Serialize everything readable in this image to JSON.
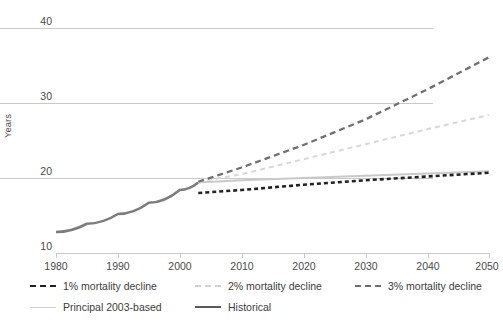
{
  "chart_data": {
    "type": "line",
    "title": "",
    "xlabel": "",
    "ylabel": "Years",
    "xlim": [
      1975,
      2050
    ],
    "ylim": [
      8.5,
      42
    ],
    "grid": true,
    "xticks": [
      1980,
      1990,
      2000,
      2010,
      2020,
      2030,
      2040,
      2050
    ],
    "yticks": [
      10,
      20,
      30,
      40
    ],
    "legend_position": "bottom",
    "series": [
      {
        "name": "Historical",
        "style": "solid",
        "color": "#7d7d7d",
        "x": [
          1980,
          1985,
          1990,
          1995,
          2000,
          2003
        ],
        "values": [
          12.8,
          13.9,
          15.2,
          16.7,
          18.4,
          19.4
        ]
      },
      {
        "name": "Principal 2003-based",
        "style": "solid",
        "color": "#c9c9c9",
        "x": [
          2003,
          2010,
          2020,
          2030,
          2040,
          2050
        ],
        "values": [
          19.4,
          19.7,
          20.0,
          20.3,
          20.6,
          20.9
        ]
      },
      {
        "name": "1% mortality decline",
        "style": "dashed",
        "color": "#222222",
        "x": [
          2003,
          2010,
          2020,
          2030,
          2040,
          2050
        ],
        "values": [
          18.0,
          18.4,
          19.1,
          19.7,
          20.2,
          20.7
        ]
      },
      {
        "name": "2% mortality decline",
        "style": "dashed",
        "color": "#d8d8d8",
        "x": [
          2003,
          2010,
          2020,
          2030,
          2040,
          2050
        ],
        "values": [
          19.5,
          20.5,
          22.5,
          24.5,
          26.5,
          28.4
        ]
      },
      {
        "name": "3% mortality decline",
        "style": "dashed",
        "color": "#707070",
        "x": [
          2003,
          2010,
          2020,
          2030,
          2040,
          2050
        ],
        "values": [
          19.5,
          21.4,
          24.4,
          27.8,
          31.8,
          36.1
        ]
      }
    ]
  },
  "axis": {
    "ylabel": "Years",
    "ytick_labels": [
      "40",
      "30",
      "20",
      "10"
    ],
    "xtick_labels": [
      "1980",
      "1990",
      "2000",
      "2010",
      "2020",
      "2030",
      "2040",
      "2050"
    ]
  },
  "legend": {
    "row1": [
      {
        "label": "1% mortality decline",
        "swatch": "dash-dark"
      },
      {
        "label": "2% mortality decline",
        "swatch": "dash-light"
      },
      {
        "label": "3% mortality decline",
        "swatch": "dash-mid"
      }
    ],
    "row2": [
      {
        "label": "Principal 2003-based",
        "swatch": "solid-light"
      },
      {
        "label": "Historical",
        "swatch": "solid-mid"
      }
    ]
  },
  "colors": {
    "grid": "#c9c9c9",
    "text": "#4a4a4a",
    "historical": "#7d7d7d",
    "principal": "#c9c9c9",
    "decline1": "#222222",
    "decline2": "#d8d8d8",
    "decline3": "#707070"
  }
}
